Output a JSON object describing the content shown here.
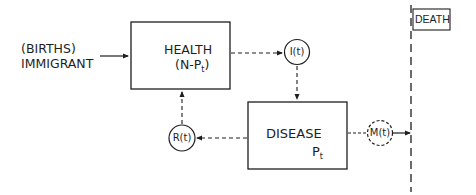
{
  "diagram": {
    "source": {
      "line1": "(BIRTHS)",
      "line2": "IMMIGRANT"
    },
    "health_box": {
      "title": "HEALTH",
      "formula_prefix": "(N-P",
      "formula_sub": "t",
      "formula_suffix": ")"
    },
    "disease_box": {
      "title": "DISEASE",
      "symbol": "P",
      "symbol_sub": "t"
    },
    "nodes": {
      "incidence": "I(t)",
      "recovery": "R(t)",
      "mortality": "M(t)"
    },
    "death_box": {
      "label": "DEATH"
    },
    "edges": [
      {
        "from": "source",
        "to": "health_box",
        "style": "solid"
      },
      {
        "from": "health_box",
        "to": "incidence",
        "style": "dashed"
      },
      {
        "from": "incidence",
        "to": "disease_box",
        "style": "dashed"
      },
      {
        "from": "disease_box",
        "to": "recovery",
        "style": "dashed"
      },
      {
        "from": "recovery",
        "to": "health_box",
        "style": "dashed"
      },
      {
        "from": "disease_box",
        "to": "mortality",
        "style": "dashed"
      },
      {
        "from": "mortality",
        "to": "death_line",
        "style": "solid"
      }
    ],
    "colors": {
      "ink": "#1e1e1e",
      "background": "#ffffff"
    }
  }
}
